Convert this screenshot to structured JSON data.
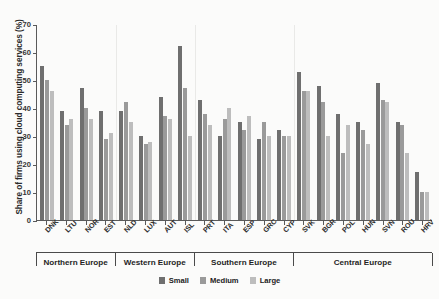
{
  "chart_data": {
    "type": "bar",
    "title": "",
    "xlabel": "",
    "ylabel": "Share of firms using cloud computing services (%)",
    "ylim": [
      0,
      70
    ],
    "yticks": [
      0,
      10,
      20,
      30,
      40,
      50,
      60,
      70
    ],
    "grid": false,
    "legend_position": "bottom-center",
    "categories": [
      "DNK",
      "LTU",
      "NOR",
      "EST",
      "NLD",
      "LUX",
      "AUT",
      "ISL",
      "PRT",
      "ITA",
      "ESP",
      "GRC",
      "CYP",
      "SVK",
      "BGR",
      "POL",
      "HUN",
      "SVN",
      "ROU",
      "HRV"
    ],
    "groups": [
      {
        "label": "Northern Europe",
        "categories": [
          "DNK",
          "LTU",
          "NOR",
          "EST"
        ]
      },
      {
        "label": "Western Europe",
        "categories": [
          "NLD",
          "LUX",
          "AUT",
          "ISL"
        ]
      },
      {
        "label": "Southern Europe",
        "categories": [
          "PRT",
          "ITA",
          "ESP",
          "GRC",
          "CYP"
        ]
      },
      {
        "label": "Central Europe",
        "categories": [
          "SVK",
          "BGR",
          "POL",
          "HUN",
          "SVN",
          "ROU",
          "HRV"
        ]
      }
    ],
    "series": [
      {
        "name": "Small",
        "color": "#6f6f6f",
        "values": [
          55,
          39,
          47,
          39,
          39,
          30,
          44,
          62,
          43,
          30,
          35,
          29,
          32,
          53,
          48,
          38,
          35,
          49,
          35,
          17
        ]
      },
      {
        "name": "Medium",
        "color": "#9a9a9a",
        "values": [
          50,
          34,
          40,
          29,
          42,
          27,
          37,
          47,
          38,
          36,
          32,
          35,
          30,
          46,
          42,
          24,
          32,
          43,
          34,
          10
        ]
      },
      {
        "name": "Large",
        "color": "#bdbdbd",
        "values": [
          46,
          36,
          36,
          31,
          35,
          28,
          36,
          30,
          34,
          40,
          37,
          30,
          30,
          46,
          30,
          34,
          27,
          42,
          24,
          10
        ]
      }
    ]
  },
  "legend": {
    "items": [
      {
        "label": "Small",
        "color": "#6f6f6f"
      },
      {
        "label": "Medium",
        "color": "#9a9a9a"
      },
      {
        "label": "Large",
        "color": "#bdbdbd"
      }
    ]
  }
}
